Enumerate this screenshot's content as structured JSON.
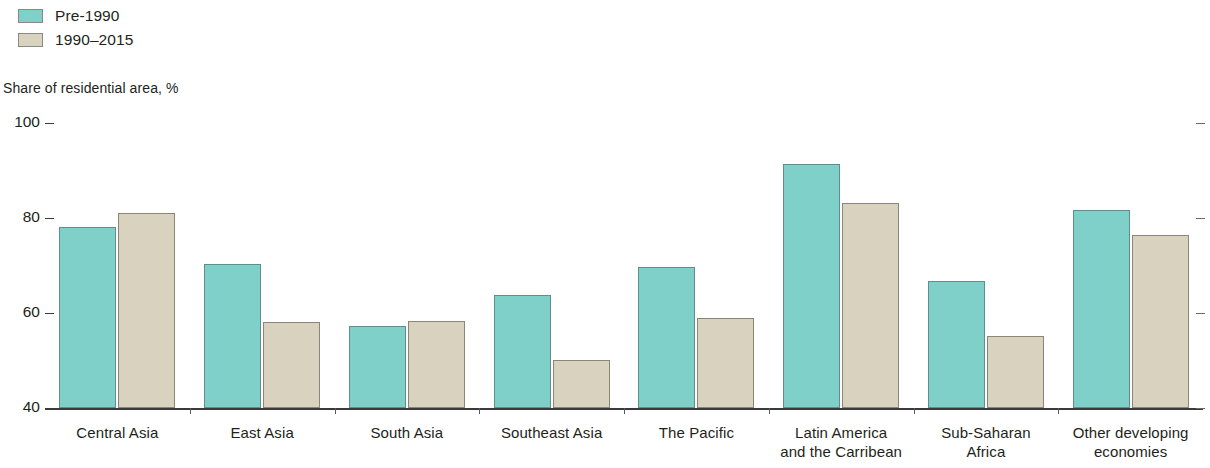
{
  "legend": {
    "items": [
      {
        "label": "Pre-1990",
        "color": "#7ed0c8",
        "icon": "legend-swatch-teal"
      },
      {
        "label": "1990–2015",
        "color": "#d8d2bf",
        "icon": "legend-swatch-beige"
      }
    ]
  },
  "axis_title": "Share of residential area, %",
  "chart_data": {
    "type": "bar",
    "title": "",
    "subtitle": "",
    "xlabel": "",
    "ylabel": "Share of residential area, %",
    "ylim": [
      40,
      100
    ],
    "yticks": [
      40,
      60,
      80,
      100
    ],
    "ytick_labels": [
      "40",
      "60",
      "80",
      "100"
    ],
    "grid": false,
    "legend_position": "top-left",
    "categories": [
      "Central Asia",
      "East Asia",
      "South Asia",
      "Southeast Asia",
      "The Pacific",
      "Latin America and the Carribean",
      "Sub-Saharan Africa",
      "Other developing economies"
    ],
    "category_lines": [
      [
        "Central Asia"
      ],
      [
        "East Asia"
      ],
      [
        "South Asia"
      ],
      [
        "Southeast Asia"
      ],
      [
        "The Pacific"
      ],
      [
        "Latin America",
        "and the Carribean"
      ],
      [
        "Sub-Saharan",
        "Africa"
      ],
      [
        "Other developing",
        "economies"
      ]
    ],
    "series": [
      {
        "name": "Pre-1990",
        "color": "#7ed0c8",
        "values": [
          78.1,
          70.3,
          57.3,
          63.8,
          69.7,
          91.4,
          66.7,
          81.7
        ]
      },
      {
        "name": "1990–2015",
        "color": "#d8d2bf",
        "values": [
          81.1,
          58.1,
          58.3,
          50.1,
          58.9,
          83.2,
          55.2,
          76.4
        ]
      }
    ]
  }
}
